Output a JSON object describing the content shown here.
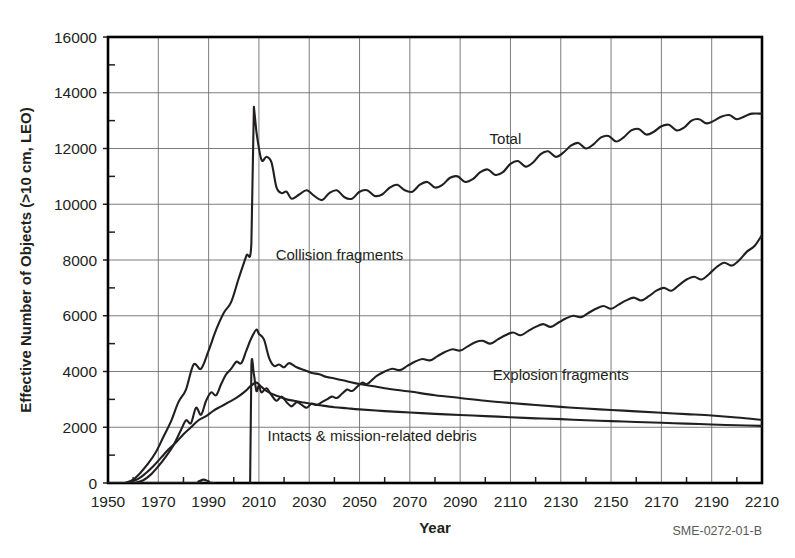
{
  "figure": {
    "id_label": "SME-0272-01-B"
  },
  "chart_data": {
    "type": "line",
    "title": "",
    "xlabel": "Year",
    "ylabel": "Effective Number of Objects (>10 cm, LEO)",
    "xlim": [
      1950,
      2210
    ],
    "ylim": [
      0,
      16000
    ],
    "grid": true,
    "legend_position": "inline-labels",
    "xticks": [
      1950,
      1970,
      1990,
      2010,
      2030,
      2050,
      2070,
      2090,
      2110,
      2130,
      2150,
      2170,
      2190,
      2210
    ],
    "xtick_labels": [
      "1950",
      "1970",
      "1990",
      "2010",
      "2030",
      "2050",
      "2070",
      "2090",
      "2110",
      "2130",
      "2150",
      "2170",
      "2190",
      "2210"
    ],
    "x_minor_interval": 10,
    "yticks": [
      0,
      2000,
      4000,
      6000,
      8000,
      10000,
      12000,
      14000,
      16000
    ],
    "ytick_labels": [
      "0",
      "2000",
      "4000",
      "6000",
      "8000",
      "10000",
      "12000",
      "14000",
      "16000"
    ],
    "y_minor_interval": 1000,
    "annotations": [
      {
        "text": "Total",
        "x": 2108,
        "y": 12150
      },
      {
        "text": "Collision fragments",
        "x": 2042,
        "y": 8000
      },
      {
        "text": "Explosion fragments",
        "x": 2130,
        "y": 3700
      },
      {
        "text": "Intacts & mission-related debris",
        "x": 2055,
        "y": 1500
      }
    ],
    "series": [
      {
        "name": "Total",
        "label": "Total",
        "x": [
          1957,
          1960,
          1963,
          1966,
          1969,
          1972,
          1975,
          1978,
          1981,
          1984,
          1987,
          1990,
          1993,
          1996,
          1999,
          2002,
          2005,
          2007,
          2008,
          2009,
          2011,
          2013,
          2015,
          2017,
          2019,
          2021,
          2023,
          2026,
          2029,
          2032,
          2035,
          2038,
          2041,
          2044,
          2047,
          2050,
          2053,
          2056,
          2059,
          2062,
          2065,
          2068,
          2071,
          2074,
          2077,
          2080,
          2083,
          2086,
          2089,
          2092,
          2095,
          2098,
          2101,
          2104,
          2107,
          2110,
          2113,
          2116,
          2119,
          2122,
          2125,
          2128,
          2131,
          2134,
          2137,
          2140,
          2143,
          2146,
          2149,
          2152,
          2155,
          2158,
          2161,
          2164,
          2167,
          2170,
          2173,
          2176,
          2179,
          2182,
          2185,
          2188,
          2191,
          2194,
          2197,
          2200,
          2203,
          2206,
          2210
        ],
        "y": [
          10,
          120,
          380,
          700,
          1100,
          1650,
          2200,
          2900,
          3350,
          4250,
          4100,
          4750,
          5500,
          6100,
          6500,
          7350,
          8150,
          8600,
          13500,
          12600,
          11600,
          11700,
          11500,
          10600,
          10400,
          10450,
          10200,
          10350,
          10500,
          10300,
          10150,
          10400,
          10500,
          10250,
          10200,
          10450,
          10500,
          10300,
          10350,
          10600,
          10700,
          10500,
          10450,
          10700,
          10800,
          10600,
          10700,
          10950,
          11000,
          10800,
          10900,
          11150,
          11250,
          11050,
          11150,
          11450,
          11550,
          11350,
          11500,
          11800,
          11900,
          11700,
          11850,
          12100,
          12200,
          12000,
          12150,
          12400,
          12450,
          12250,
          12400,
          12650,
          12700,
          12500,
          12600,
          12800,
          12850,
          12650,
          12750,
          13000,
          13050,
          12900,
          13000,
          13150,
          13200,
          13050,
          13150,
          13250,
          13250
        ]
      },
      {
        "name": "Explosion fragments",
        "label": "Explosion fragments",
        "x": [
          1961,
          1964,
          1967,
          1970,
          1973,
          1976,
          1979,
          1981,
          1983,
          1985,
          1987,
          1989,
          1991,
          1993,
          1995,
          1997,
          1999,
          2001,
          2003,
          2005,
          2007,
          2009,
          2010,
          2012,
          2014,
          2016,
          2018,
          2020,
          2022,
          2025,
          2028,
          2031,
          2034,
          2037,
          2040,
          2045,
          2050,
          2055,
          2060,
          2070,
          2080,
          2090,
          2100,
          2110,
          2120,
          2130,
          2140,
          2150,
          2160,
          2170,
          2180,
          2190,
          2200,
          2210
        ],
        "y": [
          10,
          100,
          300,
          600,
          950,
          1350,
          1900,
          2250,
          2150,
          2700,
          2450,
          2950,
          3250,
          3150,
          3550,
          3900,
          4100,
          4350,
          4300,
          4750,
          5200,
          5500,
          5350,
          5150,
          4500,
          4200,
          4250,
          4150,
          4300,
          4150,
          4050,
          3950,
          3900,
          3800,
          3750,
          3650,
          3550,
          3480,
          3400,
          3280,
          3150,
          3050,
          2950,
          2870,
          2800,
          2730,
          2670,
          2620,
          2570,
          2520,
          2470,
          2420,
          2350,
          2260
        ]
      },
      {
        "name": "Intacts & mission-related debris",
        "label": "Intacts & mission-related debris",
        "x": [
          1958,
          1962,
          1965,
          1968,
          1971,
          1974,
          1977,
          1980,
          1983,
          1986,
          1989,
          1992,
          1995,
          1998,
          2001,
          2004,
          2007,
          2009,
          2011,
          2013,
          2015,
          2018,
          2021,
          2024,
          2027,
          2030,
          2035,
          2040,
          2045,
          2050,
          2060,
          2070,
          2080,
          2090,
          2100,
          2110,
          2120,
          2130,
          2140,
          2150,
          2160,
          2170,
          2180,
          2190,
          2200,
          2210
        ],
        "y": [
          10,
          150,
          350,
          600,
          900,
          1200,
          1450,
          1750,
          2000,
          2250,
          2400,
          2600,
          2750,
          2900,
          3050,
          3250,
          3500,
          3600,
          3450,
          3300,
          3200,
          3100,
          3000,
          2950,
          2900,
          2850,
          2780,
          2720,
          2680,
          2640,
          2580,
          2530,
          2480,
          2440,
          2400,
          2360,
          2320,
          2290,
          2250,
          2220,
          2190,
          2160,
          2130,
          2100,
          2070,
          2050
        ]
      },
      {
        "name": "Collision fragments",
        "label": "Collision fragments",
        "x": [
          1950,
          1984,
          1986,
          1988,
          1990,
          1992,
          2006.5,
          2007,
          2008,
          2009,
          2010,
          2011,
          2013,
          2015,
          2017,
          2019,
          2021,
          2023,
          2025,
          2027,
          2029,
          2031,
          2033,
          2035,
          2037,
          2039,
          2041,
          2043,
          2045,
          2047,
          2049,
          2051,
          2053,
          2055,
          2057,
          2060,
          2063,
          2066,
          2069,
          2072,
          2075,
          2078,
          2081,
          2084,
          2087,
          2090,
          2093,
          2096,
          2099,
          2102,
          2105,
          2108,
          2111,
          2114,
          2117,
          2120,
          2123,
          2126,
          2129,
          2132,
          2135,
          2138,
          2141,
          2144,
          2147,
          2150,
          2153,
          2156,
          2159,
          2162,
          2165,
          2168,
          2171,
          2174,
          2177,
          2180,
          2183,
          2186,
          2189,
          2192,
          2195,
          2198,
          2201,
          2204,
          2207,
          2210
        ],
        "y": [
          0,
          0,
          60,
          120,
          60,
          0,
          0,
          4200,
          3900,
          3300,
          3500,
          3250,
          3400,
          3150,
          2950,
          3100,
          2900,
          2750,
          2900,
          2800,
          2700,
          2850,
          2800,
          2900,
          3000,
          3100,
          3050,
          3200,
          3350,
          3300,
          3450,
          3600,
          3550,
          3700,
          3850,
          4000,
          4100,
          4050,
          4200,
          4350,
          4450,
          4400,
          4550,
          4700,
          4800,
          4750,
          4900,
          5050,
          5100,
          5000,
          5150,
          5300,
          5400,
          5300,
          5450,
          5600,
          5700,
          5600,
          5750,
          5900,
          6000,
          5950,
          6100,
          6250,
          6350,
          6250,
          6400,
          6550,
          6650,
          6550,
          6700,
          6900,
          7000,
          6900,
          7100,
          7300,
          7400,
          7300,
          7500,
          7750,
          7900,
          7800,
          8000,
          8300,
          8500,
          8900
        ]
      }
    ]
  }
}
